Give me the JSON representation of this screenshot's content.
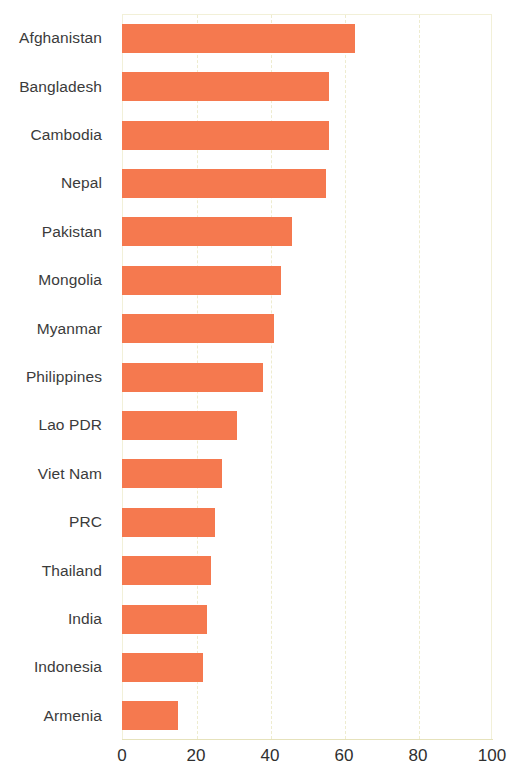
{
  "chart_data": {
    "type": "bar",
    "orientation": "horizontal",
    "title": "",
    "subtitle": "",
    "xlabel": "",
    "ylabel": "",
    "xlim": [
      0,
      100
    ],
    "ylim": null,
    "xticks": [
      "0",
      "20",
      "40",
      "60",
      "80",
      "100"
    ],
    "xtick_values": [
      0,
      20,
      40,
      60,
      80,
      100
    ],
    "grid": "vertical-dashed",
    "legend": null,
    "categories": [
      "Afghanistan",
      "Bangladesh",
      "Cambodia",
      "Nepal",
      "Pakistan",
      "Mongolia",
      "Myanmar",
      "Philippines",
      "Lao PDR",
      "Viet Nam",
      "PRC",
      "Thailand",
      "India",
      "Indonesia",
      "Armenia"
    ],
    "values": [
      63,
      56,
      56,
      55,
      46,
      43,
      41,
      38,
      31,
      27,
      25,
      24,
      23,
      22,
      15
    ],
    "series": [
      {
        "name": "",
        "color": "#f5794f",
        "values": [
          63,
          56,
          56,
          55,
          46,
          43,
          41,
          38,
          31,
          27,
          25,
          24,
          23,
          22,
          15
        ]
      }
    ],
    "colors": {
      "bar": "#f5794f",
      "grid": "#eeeccf",
      "axis": "#e6e2bb",
      "label_text": "#3b3b3b",
      "tick_text": "#2f2f2f",
      "background": "#ffffff"
    }
  }
}
